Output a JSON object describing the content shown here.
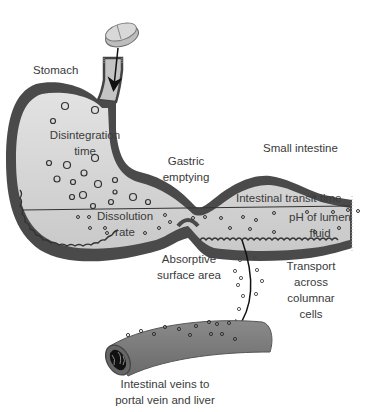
{
  "diagram": {
    "topic": "Drug absorption from tablet through GI tract",
    "labels": {
      "stomach": "Stomach",
      "disintegration_line1": "Disintegration",
      "disintegration_line2": "time",
      "gastric_line1": "Gastric",
      "gastric_line2": "emptying",
      "small_intestine": "Small intestine",
      "transit_time": "Intestinal transit time",
      "dissolution_line1": "Dissolution",
      "dissolution_line2": "rate",
      "ph_line1": "pH of lumen",
      "ph_line2": "fluid",
      "absorptive_line1": "Absorptive",
      "absorptive_line2": "surface area",
      "transport_line1": "Transport",
      "transport_line2": "across",
      "transport_line3": "columnar",
      "transport_line4": "cells",
      "veins_line1": "Intestinal veins to",
      "veins_line2": "portal vein and liver"
    },
    "colors": {
      "wall": "#4a4a4a",
      "lumen": "#d6d6d6",
      "vein": "#777777",
      "text": "#3a3a3a"
    }
  }
}
